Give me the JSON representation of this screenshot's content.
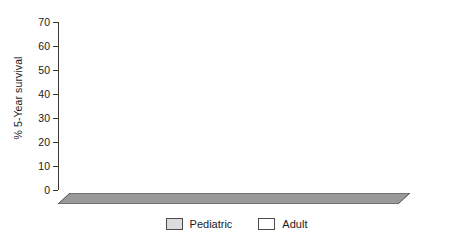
{
  "chart_data": {
    "type": "bar",
    "title": "",
    "xlabel": "",
    "ylabel": "% 5-Year survival",
    "ylim": [
      0,
      70
    ],
    "yticks": [
      0,
      10,
      20,
      30,
      40,
      50,
      60,
      70
    ],
    "grid": false,
    "legend_position": "bottom-center",
    "style": "3d-grouped-column",
    "categories": [
      "US",
      "France",
      "UK",
      "Netherlands"
    ],
    "series": [
      {
        "name": "Pediatric",
        "color": "#dcdcdc",
        "values": [
          63,
          65,
          63,
          67
        ]
      },
      {
        "name": "Adult",
        "color": "#ffffff",
        "values": [
          38,
          41,
          49,
          34
        ]
      }
    ]
  },
  "axis": {
    "y_title": "% 5-Year survival",
    "tick_labels": [
      "0",
      "10",
      "20",
      "30",
      "40",
      "50",
      "60",
      "70"
    ]
  },
  "legend": {
    "entries": [
      {
        "label": "Pediatric"
      },
      {
        "label": "Adult"
      }
    ]
  },
  "categories": [
    {
      "label": "US"
    },
    {
      "label": "France"
    },
    {
      "label": "UK"
    },
    {
      "label": "Netherlands"
    }
  ],
  "colors": {
    "pediatric_face": "#dcdcdc",
    "adult_face": "#ffffff",
    "side_shade": "#8e8e8e",
    "top_shade": "#b4b4b4",
    "axis": "#3a3a3a",
    "floor": "#9a9a9a"
  }
}
